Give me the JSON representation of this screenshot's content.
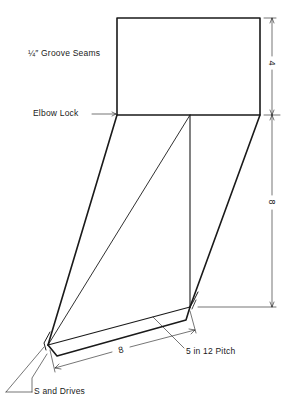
{
  "diagram": {
    "labels": {
      "groove_seams": "¼″ Groove Seams",
      "elbow_lock": "Elbow Lock",
      "s_and_drives": "S and Drives",
      "pitch": "5 in 12 Pitch"
    },
    "dimensions": {
      "rect_height": "4",
      "offset_height": "8",
      "bottom_length": "8"
    },
    "colors": {
      "line": "#1a1a1a",
      "background": "#ffffff"
    }
  }
}
